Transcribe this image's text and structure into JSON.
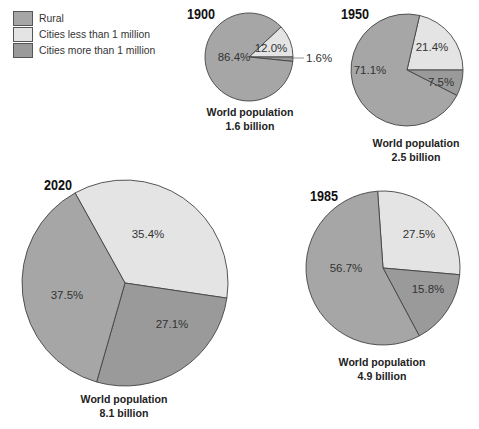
{
  "colors": {
    "rural": "#a6a6a6",
    "cities_less": "#e4e4e4",
    "cities_more": "#9a9a9a",
    "stroke": "#444444"
  },
  "legend": [
    {
      "key": "rural",
      "label": "Rural"
    },
    {
      "key": "cities_less",
      "label": "Cities less than 1 million"
    },
    {
      "key": "cities_more",
      "label": "Cities more than 1 million"
    }
  ],
  "chart_data": [
    {
      "type": "pie",
      "title": "1900",
      "caption_line1": "World population",
      "caption_line2": "1.6 billion",
      "categories": [
        "Rural",
        "Cities less than 1 million",
        "Cities more than 1 million"
      ],
      "values": [
        86.4,
        12.0,
        1.6
      ],
      "labels": [
        "86.4%",
        "12.0%",
        "1.6%"
      ]
    },
    {
      "type": "pie",
      "title": "1950",
      "caption_line1": "World population",
      "caption_line2": "2.5 billion",
      "categories": [
        "Rural",
        "Cities less than 1 million",
        "Cities more than 1 million"
      ],
      "values": [
        71.1,
        21.4,
        7.5
      ],
      "labels": [
        "71.1%",
        "21.4%",
        "7.5%"
      ]
    },
    {
      "type": "pie",
      "title": "1985",
      "caption_line1": "World population",
      "caption_line2": "4.9 billion",
      "categories": [
        "Rural",
        "Cities less than 1 million",
        "Cities more than 1 million"
      ],
      "values": [
        56.7,
        27.5,
        15.8
      ],
      "labels": [
        "56.7%",
        "27.5%",
        "15.8%"
      ]
    },
    {
      "type": "pie",
      "title": "2020",
      "caption_line1": "World population",
      "caption_line2": "8.1 billion",
      "categories": [
        "Rural",
        "Cities less than 1 million",
        "Cities more than 1 million"
      ],
      "values": [
        37.5,
        35.4,
        27.1
      ],
      "labels": [
        "37.5%",
        "35.4%",
        "27.1%"
      ]
    }
  ]
}
